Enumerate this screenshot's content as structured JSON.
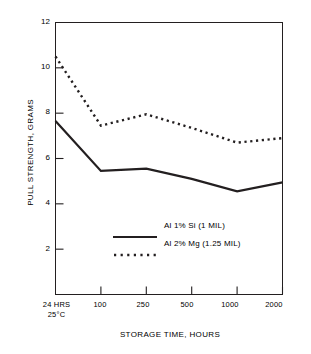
{
  "chart_data": {
    "type": "line",
    "title": "",
    "xlabel": "STORAGE TIME, HOURS",
    "ylabel": "PULL STRENGTH, GRAMS",
    "categories": [
      "24 HRS 25°C",
      "100",
      "250",
      "500",
      "1000",
      "2000"
    ],
    "xtick_labels": [
      {
        "line1": "24 HRS",
        "line2": "25°C"
      },
      {
        "line1": "100",
        "line2": ""
      },
      {
        "line1": "250",
        "line2": ""
      },
      {
        "line1": "500",
        "line2": ""
      },
      {
        "line1": "1000",
        "line2": ""
      },
      {
        "line1": "2000",
        "line2": ""
      }
    ],
    "ylim": [
      0,
      12
    ],
    "ytick_labels": [
      "12",
      "10",
      "8",
      "6",
      "4",
      "2"
    ],
    "yticks": [
      12,
      10,
      8,
      6,
      4,
      2
    ],
    "grid": false,
    "legend_position": "inside-center",
    "series": [
      {
        "name": "Al 1% Si (1 MIL)",
        "style": "solid",
        "color": "#231f20",
        "values": [
          7.65,
          5.45,
          5.55,
          5.1,
          4.55,
          4.95
        ]
      },
      {
        "name": "Al 2% Mg (1.25 MIL)",
        "style": "dotted",
        "color": "#231f20",
        "values": [
          10.5,
          7.45,
          7.95,
          7.35,
          6.7,
          6.9
        ]
      }
    ]
  },
  "legend": {
    "items": [
      {
        "label": "Al 1% Si (1 MIL)",
        "style": "solid"
      },
      {
        "label": "Al 2% Mg (1.25 MIL)",
        "style": "dotted"
      }
    ]
  },
  "colors": {
    "axis": "#231f20",
    "series_1": "#231f20",
    "series_2": "#231f20",
    "background": "#ffffff"
  }
}
